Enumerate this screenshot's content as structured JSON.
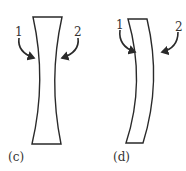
{
  "figures": [
    {
      "id": "c",
      "label": "(c)",
      "type": "biconcave-lens",
      "arrow_labels": [
        "1",
        "2"
      ]
    },
    {
      "id": "d",
      "label": "(d)",
      "type": "meniscus-lens",
      "arrow_labels": [
        "1",
        "2"
      ]
    }
  ],
  "colors": {
    "stroke": "#2a2a2a",
    "background": "#ffffff"
  }
}
